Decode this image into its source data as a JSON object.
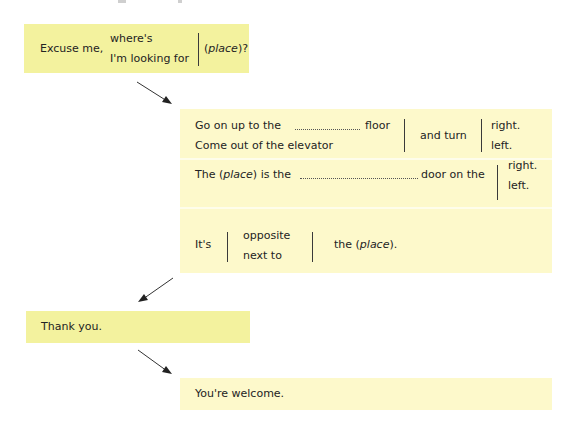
{
  "colors": {
    "strong_yellow": "#f3f29e",
    "pale_yellow": "#fdf9cb",
    "text": "#232323"
  },
  "step1": {
    "lead": "Excuse me,",
    "options": [
      "where's",
      "I'm looking for"
    ],
    "placeholder_italic": "place",
    "open_paren": "(",
    "tail": ")?"
  },
  "step2": {
    "row1": {
      "lines": [
        "Go on up to the",
        "Come out of the elevator"
      ],
      "after_blank": "floor",
      "middle": "and turn",
      "options": [
        "right.",
        "left."
      ]
    },
    "row2": {
      "prefix": "The (",
      "placeholder_italic": "place",
      "suffix": ") is the",
      "after_blank": "door on the",
      "options": [
        "right.",
        "left."
      ]
    },
    "row3": {
      "lead": "It's",
      "options": [
        "opposite",
        "next to"
      ],
      "prefix": "the (",
      "placeholder_italic": "place",
      "suffix": ")."
    }
  },
  "step3": {
    "text": "Thank you."
  },
  "step4": {
    "text": "You're welcome."
  }
}
